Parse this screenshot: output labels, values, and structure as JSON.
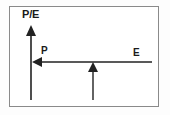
{
  "diagram": {
    "background_color": "#ffffff",
    "border_color": "#8a8a8a",
    "stroke_color": "#222222",
    "labels": {
      "vertical_axis": "P/E",
      "left_arrow": "P",
      "right_end": "E"
    },
    "arrows": [
      {
        "name": "pe-vertical-arrow",
        "label": "P/E",
        "direction": "up",
        "x": 31,
        "from_y": 100,
        "to_y": 25
      },
      {
        "name": "p-horizontal-arrow",
        "label": "P",
        "direction": "left",
        "y": 62,
        "from_x": 152,
        "to_x": 32
      },
      {
        "name": "e-middle-arrow",
        "label": "E",
        "direction": "up",
        "x": 93,
        "from_y": 100,
        "to_y": 62
      }
    ]
  }
}
